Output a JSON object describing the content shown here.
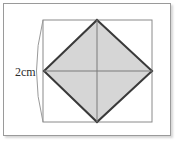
{
  "figure": {
    "labels": {
      "side_measure": "2cm"
    },
    "colors": {
      "diamond_fill": "#d6d6d6",
      "diamond_stroke": "#3a3a3a",
      "square_stroke": "#8a8a8a",
      "arc_stroke": "#9a9a9a",
      "diagonal_stroke": "#7a7a7a",
      "frame_stroke": "#9a9a9a",
      "background": "#ffffff"
    },
    "geometry": {
      "square": {
        "left": 43,
        "top": 20,
        "right": 152,
        "bottom": 122
      },
      "diamond_vertices": [
        {
          "name": "top",
          "x": 97,
          "y": 20
        },
        {
          "name": "right",
          "x": 152,
          "y": 71
        },
        {
          "name": "bottom",
          "x": 97,
          "y": 122
        },
        {
          "name": "left",
          "x": 44,
          "y": 71
        }
      ],
      "arc": {
        "start_x": 43,
        "start_y": 20,
        "end_x": 43,
        "end_y": 122,
        "bulge_x": 31
      },
      "center": {
        "x": 97,
        "y": 71
      }
    }
  }
}
